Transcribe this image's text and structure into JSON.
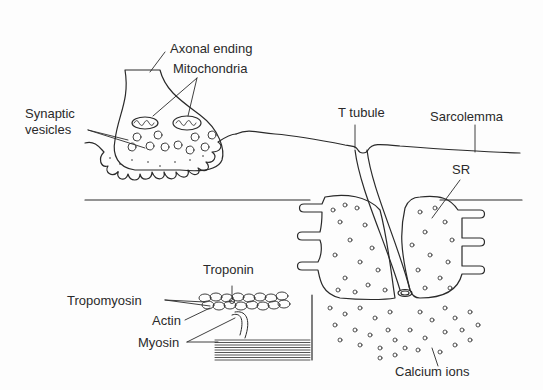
{
  "diagram": {
    "type": "anatomical-illustration",
    "stroke_color": "#2a2a2a",
    "background": "#fdfdfd"
  },
  "labels": {
    "axonal_ending": "Axonal ending",
    "mitochondria": "Mitochondria",
    "synaptic_vesicles_line1": "Synaptic",
    "synaptic_vesicles_line2": "vesicles",
    "t_tubule": "T tubule",
    "sarcolemma": "Sarcolemma",
    "sr": "SR",
    "troponin": "Troponin",
    "tropomyosin": "Tropomyosin",
    "actin": "Actin",
    "myosin": "Myosin",
    "calcium_ions": "Calcium ions"
  }
}
